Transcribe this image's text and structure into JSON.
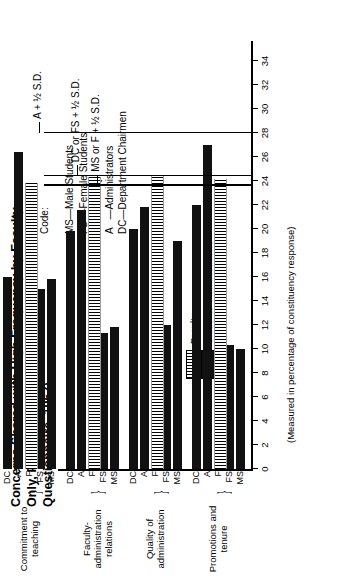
{
  "chart_data": {
    "type": "bar",
    "orientation": "horizontal",
    "title": "Concerns Shared with High Frequency by Faculty Only, Public Campuses (Pre-Interview Questionnaire, 1967)",
    "xlabel": "",
    "ylabel": "(Measured in percentage of constituency response)",
    "ylim": [
      0,
      34
    ],
    "yticks": [
      0,
      2,
      4,
      6,
      8,
      10,
      12,
      14,
      16,
      18,
      20,
      22,
      24,
      26,
      28,
      30,
      32,
      34
    ],
    "grid": false,
    "legend_position": "upper-left",
    "legend": [
      {
        "label": "Faculty",
        "pattern": "hatched"
      },
      {
        "label": "Students–Administrators",
        "pattern": "solid"
      }
    ],
    "code_heading": "Code:",
    "code_entries": [
      "MS—Male Students",
      "FS —Female Students",
      "F   —Faculty",
      "A   —Administrators",
      "DC—Department Chairmen"
    ],
    "series_codes": [
      "MS",
      "FS",
      "F",
      "A",
      "DC"
    ],
    "categories": [
      "Promotions and tenure",
      "Quality of administration",
      "Faculty-administration relations",
      "Commitment to teaching"
    ],
    "groups": [
      {
        "name": "Promotions and tenure",
        "label_codes": "MS FS  F   A  DC",
        "bars": [
          {
            "code": "MS",
            "value": 10.0,
            "pattern": "solid"
          },
          {
            "code": "FS",
            "value": 10.3,
            "pattern": "solid"
          },
          {
            "code": "F",
            "value": 24.2,
            "pattern": "hatched"
          },
          {
            "code": "A",
            "value": 27.0,
            "pattern": "solid"
          },
          {
            "code": "DC",
            "value": 22.0,
            "pattern": "solid"
          }
        ]
      },
      {
        "name": "Quality of administration",
        "label_codes": "MS FS  F   A  DC",
        "bars": [
          {
            "code": "MS",
            "value": 19.0,
            "pattern": "solid"
          },
          {
            "code": "FS",
            "value": 12.0,
            "pattern": "solid"
          },
          {
            "code": "F",
            "value": 24.5,
            "pattern": "hatched"
          },
          {
            "code": "A",
            "value": 21.8,
            "pattern": "solid"
          },
          {
            "code": "DC",
            "value": 20.0,
            "pattern": "solid"
          }
        ]
      },
      {
        "name": "Faculty-administration relations",
        "label_codes": "MS FS  F   A  DC",
        "bars": [
          {
            "code": "MS",
            "value": 11.8,
            "pattern": "solid"
          },
          {
            "code": "FS",
            "value": 11.3,
            "pattern": "solid"
          },
          {
            "code": "F",
            "value": 24.3,
            "pattern": "hatched"
          },
          {
            "code": "A",
            "value": 21.6,
            "pattern": "solid"
          },
          {
            "code": "DC",
            "value": 19.8,
            "pattern": "solid"
          }
        ]
      },
      {
        "name": "Commitment to teaching",
        "label_codes": "MS FS  F   A  DC",
        "bars": [
          {
            "code": "MS",
            "value": 15.8,
            "pattern": "solid"
          },
          {
            "code": "FS",
            "value": 15.0,
            "pattern": "solid"
          },
          {
            "code": "F",
            "value": 23.8,
            "pattern": "hatched"
          },
          {
            "code": "A",
            "value": 26.4,
            "pattern": "solid"
          },
          {
            "code": "DC",
            "value": 16.0,
            "pattern": "solid"
          }
        ]
      }
    ],
    "reference_lines": [
      {
        "label": "A + ½ S.D.",
        "value": 28.0
      },
      {
        "label": "DC or FS + ½ S.D.",
        "value": 24.4
      },
      {
        "label": "MS or F + ½ S.D.",
        "value": 23.6
      }
    ]
  }
}
